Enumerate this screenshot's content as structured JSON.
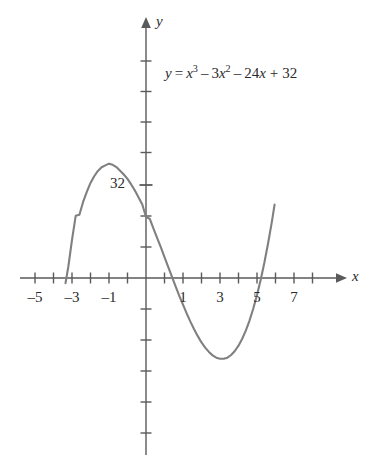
{
  "figure": {
    "background_color": "#ffffff",
    "curve_color": "#808080",
    "axis_color": "#5a5a5a",
    "text_color": "#2b2b2b"
  },
  "equation": {
    "lhs": "y",
    "equals": "=",
    "term1_base": "x",
    "term1_exp": "3",
    "op1": "–",
    "term2_coef": "3",
    "term2_base": "x",
    "term2_exp": "2",
    "op2": "–",
    "term3": "24",
    "term3_var": "x",
    "op3": "+",
    "term4": "32",
    "full_text": "y = x³ – 3x² – 24x + 32"
  },
  "axes": {
    "x_axis_label": "x",
    "y_axis_label": "y",
    "x_tick_labels": [
      "–5",
      "–3",
      "–1",
      "1",
      "3",
      "5",
      "7"
    ],
    "y_tick_labels": [
      "32"
    ]
  },
  "chart_data": {
    "type": "line",
    "title": "",
    "subtitle": "",
    "xlabel": "x",
    "ylabel": "y",
    "annotations": [
      "y = x³ – 3x² – 24x + 32"
    ],
    "legend": [],
    "legend_position": "none",
    "grid": false,
    "xlim": [
      -5.6,
      7.9
    ],
    "ylim": [
      -88,
      88
    ],
    "x_ticks": [
      -5,
      -4,
      -3,
      -2,
      -1,
      0,
      1,
      2,
      3,
      4,
      5,
      6,
      7
    ],
    "x_tick_labels_shown": [
      -5,
      -3,
      -1,
      1,
      3,
      5,
      7
    ],
    "y_ticks": [
      -80,
      -64,
      -48,
      -32,
      -16,
      16,
      32,
      48,
      64,
      80
    ],
    "y_tick_labels_shown": [
      32
    ],
    "series": [
      {
        "name": "y = x^3 - 3x^2 - 24x + 32",
        "color": "#808080",
        "x": [
          -4.35,
          -4.2,
          -4.0,
          -3.8,
          -3.6,
          -3.4,
          -3.2,
          -3.0,
          -2.8,
          -2.6,
          -2.4,
          -2.2,
          -2.0,
          -1.8,
          -1.6,
          -1.4,
          -1.2,
          -1.0,
          -0.8,
          -0.6,
          -0.4,
          -0.2,
          0.0,
          0.2,
          0.4,
          0.6,
          0.8,
          1.0,
          1.2,
          1.4,
          1.6,
          1.8,
          2.0,
          2.2,
          2.4,
          2.6,
          2.8,
          3.0,
          3.2,
          3.4,
          3.6,
          3.8,
          4.0,
          4.2,
          4.4,
          4.6,
          4.8,
          5.0,
          5.2,
          5.4,
          5.6,
          5.8,
          6.0,
          6.2,
          6.4,
          6.6,
          6.8,
          6.95
        ],
        "y": [
          -2.7,
          5.9,
          20.0,
          32.6,
          33.2,
          39.9,
          45.2,
          49.9,
          53.4,
          56.2,
          58.1,
          59.1,
          60.0,
          59.4,
          58.2,
          56.3,
          54.3,
          52.0,
          49.1,
          45.9,
          42.3,
          38.6,
          32.0,
          31.1,
          26.0,
          21.1,
          16.2,
          11.0,
          5.9,
          0.7,
          -4.4,
          -9.4,
          -14.0,
          -18.6,
          -22.9,
          -26.9,
          -30.5,
          -33.8,
          -36.5,
          -38.8,
          -40.6,
          -41.8,
          -42.4,
          -42.4,
          -41.8,
          -40.4,
          -38.3,
          -35.5,
          -31.9,
          -27.5,
          -22.2,
          -16.0,
          -8.9,
          -0.9,
          8.1,
          18.2,
          29.3,
          38.5
        ],
        "x_intercepts": [
          -4.3,
          1.2,
          6.05
        ],
        "y_intercept": 32,
        "local_max": {
          "x": -2.0,
          "y": 60
        },
        "local_min": {
          "x": 4.1,
          "y": -42.5
        }
      }
    ]
  }
}
